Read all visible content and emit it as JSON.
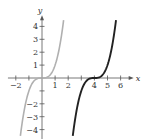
{
  "chart_data": {
    "type": "line",
    "title": "",
    "xlabel": "x",
    "ylabel": "y",
    "xlim": [
      -2.6,
      7.0
    ],
    "ylim": [
      -4.5,
      4.7
    ],
    "grid": false,
    "legend": null,
    "x_ticks": [
      -2,
      -1,
      1,
      2,
      3,
      4,
      5,
      6
    ],
    "x_tick_labels": [
      {
        "value": -2,
        "label": "−2"
      },
      {
        "value": 1,
        "label": "1"
      },
      {
        "value": 2,
        "label": "2"
      },
      {
        "value": 4,
        "label": "4"
      },
      {
        "value": 5,
        "label": "5"
      },
      {
        "value": 6,
        "label": "6"
      }
    ],
    "y_ticks": [
      -4,
      -3,
      -2,
      -1,
      1,
      2,
      3,
      4
    ],
    "y_tick_labels": [
      {
        "value": 4,
        "label": "4"
      },
      {
        "value": 3,
        "label": "3"
      },
      {
        "value": 2,
        "label": "2"
      },
      {
        "value": 1,
        "label": "1"
      },
      {
        "value": -2,
        "label": "−2"
      },
      {
        "value": -3,
        "label": "−3"
      },
      {
        "value": -4,
        "label": "−4"
      }
    ],
    "series": [
      {
        "name": "y = x^3",
        "color": "#b0b0b0",
        "x": [
          -1.65,
          -1.5,
          -1.25,
          -1.0,
          -0.75,
          -0.5,
          -0.25,
          0,
          0.25,
          0.5,
          0.75,
          1.0,
          1.25,
          1.5,
          1.65
        ],
        "y": [
          -4.49,
          -3.375,
          -1.953,
          -1.0,
          -0.422,
          -0.125,
          -0.016,
          0,
          0.016,
          0.125,
          0.422,
          1.0,
          1.953,
          3.375,
          4.49
        ]
      },
      {
        "name": "y = (x-4)^3",
        "color": "#222222",
        "x": [
          2.35,
          2.5,
          2.75,
          3.0,
          3.25,
          3.5,
          3.75,
          4.0,
          4.25,
          4.5,
          4.75,
          5.0,
          5.25,
          5.5,
          5.65
        ],
        "y": [
          -4.49,
          -3.375,
          -1.953,
          -1.0,
          -0.422,
          -0.125,
          -0.016,
          0,
          0.016,
          0.125,
          0.422,
          1.0,
          1.953,
          3.375,
          4.49
        ]
      }
    ]
  },
  "axes": {
    "x_label": "x",
    "y_label": "y"
  }
}
